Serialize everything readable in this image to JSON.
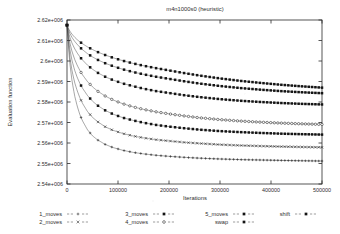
{
  "chart_data": {
    "type": "line",
    "title": "m4n1000s0 (heuristic)",
    "xlabel": "Iterations",
    "ylabel": "Evaluation function",
    "xlim": [
      0,
      500000
    ],
    "ylim": [
      2540000,
      2620000
    ],
    "grid": false,
    "legend_position": "bottom",
    "xticks": [
      0,
      100000,
      200000,
      300000,
      400000,
      500000
    ],
    "xticklabels": [
      "0",
      "100000",
      "200000",
      "300000",
      "400000",
      "500000"
    ],
    "yticks": [
      2540000,
      2550000,
      2560000,
      2570000,
      2580000,
      2590000,
      2600000,
      2610000,
      2620000
    ],
    "yticklabels": [
      "2.54e+006",
      "2.55e+006",
      "2.56e+006",
      "2.57e+006",
      "2.58e+006",
      "2.59e+006",
      "2.6e+006",
      "2.61e+006",
      "2.62e+006"
    ],
    "x": [
      0,
      5000,
      10000,
      15000,
      20000,
      25000,
      30000,
      40000,
      50000,
      60000,
      75000,
      90000,
      110000,
      130000,
      150000,
      175000,
      200000,
      230000,
      260000,
      300000,
      340000,
      380000,
      420000,
      460000,
      500000
    ],
    "series": [
      {
        "name": "1_moves",
        "marker": "plus",
        "marker_filled": false,
        "values": [
          2617500,
          2600000,
          2590000,
          2583000,
          2578000,
          2574000,
          2571000,
          2566500,
          2563500,
          2561500,
          2559300,
          2557800,
          2556400,
          2555400,
          2554700,
          2554000,
          2553500,
          2553000,
          2552600,
          2552200,
          2551900,
          2551700,
          2551500,
          2551350,
          2551200
        ]
      },
      {
        "name": "2_moves",
        "marker": "cross",
        "marker_filled": false,
        "values": [
          2617500,
          2603000,
          2595000,
          2589500,
          2585500,
          2582200,
          2579500,
          2575400,
          2572500,
          2570400,
          2567900,
          2566200,
          2564600,
          2563400,
          2562500,
          2561600,
          2561000,
          2560300,
          2559800,
          2559200,
          2558800,
          2558500,
          2558250,
          2558050,
          2557900
        ]
      },
      {
        "name": "3_moves",
        "marker": "filled-square",
        "marker_filled": true,
        "values": [
          2617500,
          2606500,
          2600000,
          2595500,
          2592000,
          2589200,
          2586900,
          2583200,
          2580400,
          2578300,
          2575900,
          2574100,
          2572300,
          2571000,
          2569900,
          2568800,
          2568000,
          2567200,
          2566500,
          2565800,
          2565300,
          2564900,
          2564550,
          2564300,
          2564100
        ]
      },
      {
        "name": "4_moves",
        "marker": "open-circle",
        "marker_filled": false,
        "values": [
          2617500,
          2609500,
          2604500,
          2600800,
          2597900,
          2595500,
          2593400,
          2590000,
          2587400,
          2585300,
          2582900,
          2581000,
          2579100,
          2577600,
          2576400,
          2575200,
          2574200,
          2573200,
          2572300,
          2571400,
          2570700,
          2570150,
          2569700,
          2569350,
          2569050
        ]
      },
      {
        "name": "5_moves",
        "marker": "filled-square",
        "marker_filled": true,
        "values": [
          2617500,
          2612000,
          2608600,
          2606000,
          2603900,
          2602100,
          2600600,
          2598000,
          2596000,
          2594300,
          2592300,
          2590700,
          2589000,
          2587700,
          2586500,
          2585300,
          2584400,
          2583300,
          2582400,
          2581400,
          2580600,
          2580000,
          2579500,
          2579100,
          2578800
        ]
      },
      {
        "name": "swap",
        "marker": "filled-square",
        "marker_filled": true,
        "values": [
          2617500,
          2613800,
          2611400,
          2609600,
          2608100,
          2606800,
          2605600,
          2603600,
          2602000,
          2600600,
          2598900,
          2597500,
          2595900,
          2594600,
          2593500,
          2592300,
          2591300,
          2590100,
          2589000,
          2587800,
          2586800,
          2586000,
          2585300,
          2584750,
          2584300
        ]
      },
      {
        "name": "shift",
        "marker": "filled-square",
        "marker_filled": true,
        "values": [
          2617500,
          2614800,
          2613000,
          2611600,
          2610400,
          2609400,
          2608500,
          2606900,
          2605600,
          2604400,
          2602900,
          2601600,
          2600100,
          2598800,
          2597700,
          2596500,
          2595400,
          2594100,
          2592900,
          2591500,
          2590300,
          2589300,
          2588400,
          2587650,
          2587000
        ]
      }
    ]
  },
  "legend": {
    "entries": [
      {
        "label": "1_moves",
        "marker": "plus"
      },
      {
        "label": "2_moves",
        "marker": "cross"
      },
      {
        "label": "3_moves",
        "marker": "filled-square"
      },
      {
        "label": "4_moves",
        "marker": "open-circle"
      },
      {
        "label": "5_moves",
        "marker": "filled-square"
      },
      {
        "label": "swap",
        "marker": "filled-square"
      },
      {
        "label": "shift",
        "marker": "filled-square"
      }
    ]
  }
}
